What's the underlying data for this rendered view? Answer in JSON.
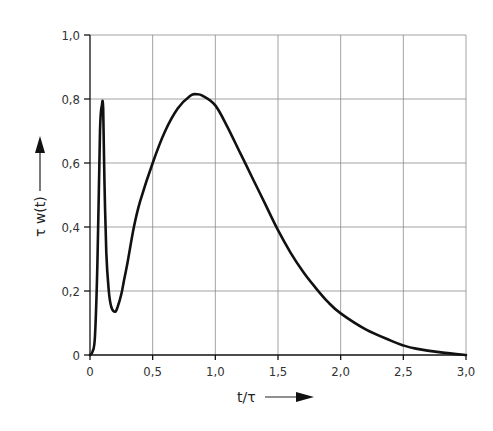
{
  "chart_data": {
    "type": "line",
    "title": "",
    "xlabel": "t/τ",
    "ylabel": "τ w(t)",
    "xlim": [
      0,
      3.0
    ],
    "ylim": [
      0,
      1.0
    ],
    "grid": true,
    "legend": null,
    "x_ticks": [
      "0",
      "0,5",
      "1,0",
      "1,5",
      "2,0",
      "2,5",
      "3,0"
    ],
    "y_ticks": [
      "0",
      "0,2",
      "0,4",
      "0,6",
      "0,8",
      "1,0"
    ],
    "series": [
      {
        "name": "τ w(t)",
        "x": [
          0,
          0.02,
          0.04,
          0.06,
          0.08,
          0.095,
          0.105,
          0.115,
          0.13,
          0.15,
          0.17,
          0.2,
          0.22,
          0.25,
          0.27,
          0.3,
          0.35,
          0.4,
          0.5,
          0.6,
          0.7,
          0.8,
          0.85,
          0.9,
          1.0,
          1.1,
          1.2,
          1.3,
          1.4,
          1.5,
          1.6,
          1.7,
          1.8,
          1.9,
          2.0,
          2.2,
          2.4,
          2.5,
          2.6,
          2.8,
          3.0
        ],
        "values": [
          0,
          0.01,
          0.06,
          0.3,
          0.7,
          0.78,
          0.77,
          0.55,
          0.32,
          0.2,
          0.15,
          0.135,
          0.15,
          0.19,
          0.23,
          0.29,
          0.4,
          0.48,
          0.6,
          0.7,
          0.77,
          0.81,
          0.815,
          0.81,
          0.78,
          0.71,
          0.63,
          0.55,
          0.47,
          0.39,
          0.32,
          0.26,
          0.21,
          0.165,
          0.13,
          0.08,
          0.045,
          0.03,
          0.02,
          0.008,
          0
        ]
      }
    ],
    "annotations": [
      "arrow along y-axis label pointing up",
      "arrow along x-axis label pointing right"
    ]
  },
  "labels": {
    "x_axis": "t/τ",
    "y_axis": "τ w(t)"
  }
}
